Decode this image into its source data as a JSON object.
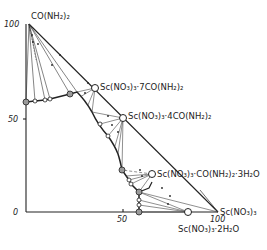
{
  "diagram": {
    "type": "ternary-phase-diagram (right-triangle projection)",
    "system": "Sc(NO3)3 - CO(NH2)2 - H2O",
    "axes": {
      "y_ticks": [
        "100",
        "50",
        "0"
      ],
      "x_ticks": [
        "50",
        "100"
      ]
    },
    "labels": {
      "urea": "CO(NH₂)₂",
      "comp_7": "Sc(NO₃)₃·7CO(NH₂)₂",
      "comp_4": "Sc(NO₃)₃·4CO(NH₂)₂",
      "comp_1": "Sc(NO₃)₃·CO(NH₂)₂·3H₂O",
      "sc_nitrate": "Sc(NO₃)₃",
      "dihydrate": "Sc(NO₃)₃·2H₂O"
    },
    "colors": {
      "line": "#222222",
      "thin_line": "#555555",
      "point_fill": "#ffffff",
      "eutonic_fill": "#9a9a9a"
    }
  }
}
